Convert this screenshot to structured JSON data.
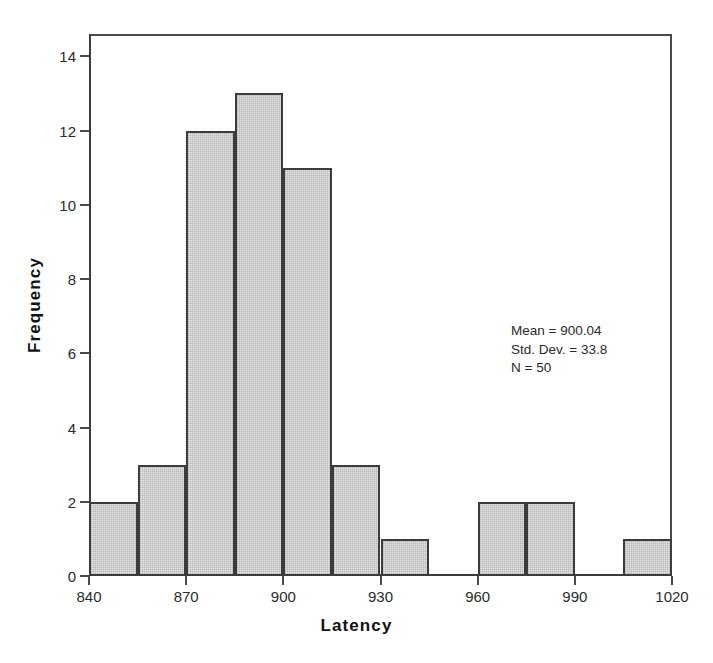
{
  "chart_data": {
    "type": "bar",
    "title": "",
    "subtitle": "",
    "xlabel": "Latency",
    "ylabel": "Frequency",
    "xlim": [
      840,
      1020
    ],
    "ylim": [
      0,
      14.6
    ],
    "grid": false,
    "legend": "none",
    "bin_width": 15,
    "x_ticks": [
      840,
      870,
      900,
      930,
      960,
      990,
      1020
    ],
    "x_tick_labels": [
      "840",
      "870",
      "900",
      "930",
      "960",
      "990",
      "1020"
    ],
    "y_ticks": [
      0,
      2,
      4,
      6,
      8,
      10,
      12,
      14
    ],
    "y_tick_labels": [
      "0",
      "2",
      "4",
      "6",
      "8",
      "10",
      "12",
      "14"
    ],
    "categories": [
      "840-855",
      "855-870",
      "870-885",
      "885-900",
      "900-915",
      "915-930",
      "930-945",
      "945-960",
      "960-975",
      "975-990",
      "990-1005",
      "1005-1020"
    ],
    "bin_starts": [
      840,
      855,
      870,
      885,
      900,
      915,
      930,
      945,
      960,
      975,
      990,
      1005
    ],
    "bin_ends": [
      855,
      870,
      885,
      900,
      915,
      930,
      945,
      960,
      975,
      990,
      1005,
      1020
    ],
    "values": [
      2,
      3,
      12,
      13,
      11,
      3,
      1,
      0,
      2,
      2,
      0,
      1
    ],
    "annotations": [
      "Mean = 900.04",
      "Std. Dev. = 33.8",
      "N = 50"
    ]
  },
  "stats": {
    "mean_line": "Mean = 900.04",
    "stddev_line": "Std. Dev. = 33.8",
    "n_line": "N = 50"
  },
  "colors": {
    "bar_fill": "#e4e4e4",
    "bar_edge": "#3c3c3c",
    "axis": "#4a4a4a",
    "text": "#2b2b2b",
    "background": "#ffffff"
  }
}
